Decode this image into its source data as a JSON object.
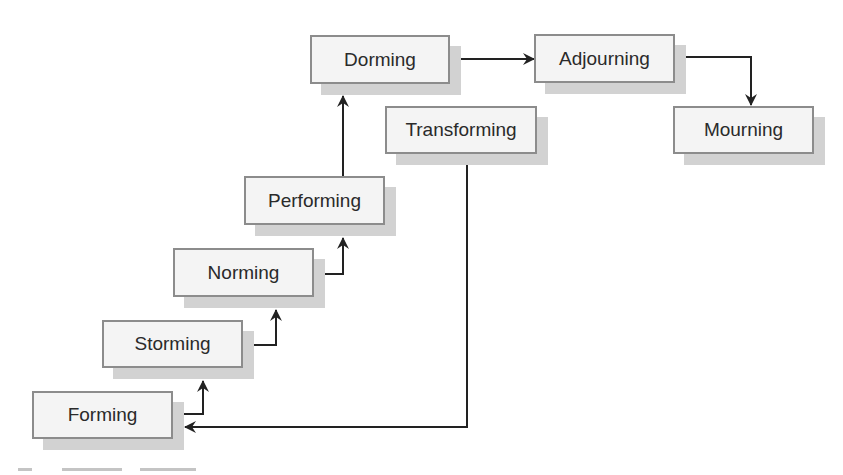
{
  "diagram": {
    "type": "stage-flow",
    "colors": {
      "box_fill": "#f4f4f4",
      "box_border": "#8c8c8c",
      "shadow": "#d2d2d2",
      "connector": "#222222",
      "text": "#2a2a2a"
    },
    "nodes": [
      {
        "id": "forming",
        "label": "Forming"
      },
      {
        "id": "storming",
        "label": "Storming"
      },
      {
        "id": "norming",
        "label": "Norming"
      },
      {
        "id": "performing",
        "label": "Performing"
      },
      {
        "id": "dorming",
        "label": "Dorming"
      },
      {
        "id": "adjourning",
        "label": "Adjourning"
      },
      {
        "id": "mourning",
        "label": "Mourning"
      },
      {
        "id": "transforming",
        "label": "Transforming"
      }
    ],
    "edges": [
      {
        "from": "forming",
        "to": "storming"
      },
      {
        "from": "storming",
        "to": "norming"
      },
      {
        "from": "norming",
        "to": "performing"
      },
      {
        "from": "performing",
        "to": "dorming"
      },
      {
        "from": "dorming",
        "to": "adjourning"
      },
      {
        "from": "adjourning",
        "to": "mourning"
      },
      {
        "from": "transforming",
        "to": "forming"
      }
    ]
  }
}
